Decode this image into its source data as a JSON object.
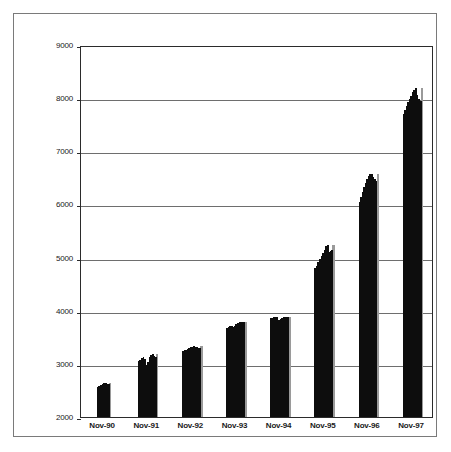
{
  "chart_data": {
    "type": "bar",
    "title": "",
    "subtitle": "",
    "xlabel": "",
    "ylabel": "",
    "ylim": [
      2000,
      9000
    ],
    "y_ticks": [
      2000,
      3000,
      4000,
      5000,
      6000,
      7000,
      8000,
      9000
    ],
    "y_tick_labels": [
      "2000",
      "3000",
      "4000",
      "5000",
      "6000",
      "7000",
      "8000",
      "9000"
    ],
    "grid": true,
    "legend": null,
    "legend_position": "none",
    "categories": [
      "Nov-90",
      "Nov-91",
      "Nov-92",
      "Nov-93",
      "Nov-94",
      "Nov-95",
      "Nov-96",
      "Nov-97"
    ],
    "category_tick_labels": [
      "Nov-90",
      "Nov-91",
      "Nov-92",
      "Nov-93",
      "Nov-94",
      "Nov-95",
      "Nov-96",
      "Nov-97"
    ],
    "note": "Dense monthly bar series; only November of each year is tick-labelled. Values below are the monthly bar heights in plot order.",
    "series": [
      {
        "name": "value",
        "color": "#0d0d0d",
        "groups": [
          {
            "label": "Nov-90",
            "values": [
              2560,
              2580,
              2600,
              2620,
              2635,
              2640,
              2630,
              2625
            ]
          },
          {
            "label": "Nov-91",
            "values": [
              3050,
              3080,
              3110,
              3130,
              3090,
              2980,
              3040,
              3120,
              3160,
              3180,
              3150,
              3120
            ]
          },
          {
            "label": "Nov-92",
            "values": [
              3240,
              3255,
              3270,
              3285,
              3300,
              3310,
              3320,
              3330,
              3325,
              3315,
              3300,
              3290
            ]
          },
          {
            "label": "Nov-93",
            "values": [
              3680,
              3695,
              3705,
              3715,
              3700,
              3720,
              3745,
              3765,
              3780,
              3790,
              3785,
              3780
            ]
          },
          {
            "label": "Nov-94",
            "values": [
              3860,
              3870,
              3880,
              3885,
              3875,
              3820,
              3840,
              3865,
              3880,
              3885,
              3880,
              3875
            ]
          },
          {
            "label": "Nov-95",
            "values": [
              4800,
              4850,
              4910,
              4970,
              5030,
              5090,
              5150,
              5210,
              5230,
              5100,
              5120,
              5140
            ]
          },
          {
            "label": "Nov-96",
            "values": [
              6050,
              6140,
              6230,
              6320,
              6400,
              6470,
              6530,
              6570,
              6580,
              6520,
              6470,
              6440
            ]
          },
          {
            "label": "Nov-97",
            "values": [
              7700,
              7780,
              7850,
              7920,
              7990,
              8050,
              8110,
              8160,
              8200,
              8060,
              7980,
              7950
            ]
          }
        ]
      }
    ]
  },
  "axes": {
    "y_min_label": "2000",
    "y_max_label": "9000"
  }
}
